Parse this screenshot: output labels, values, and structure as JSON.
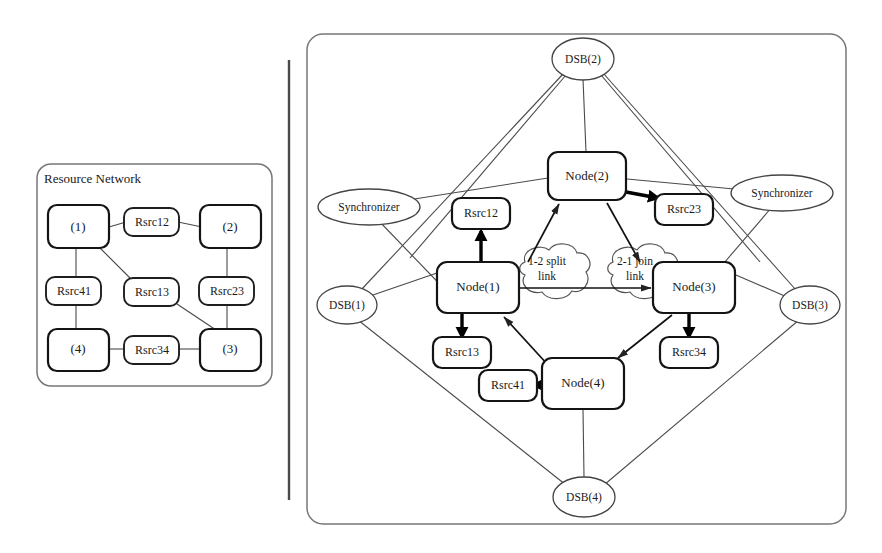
{
  "figure": {
    "type": "diagram"
  },
  "left_panel": {
    "title": "Resource Network",
    "nodes": [
      {
        "id": "n1",
        "label": "(1)",
        "x": 76,
        "y": 227
      },
      {
        "id": "n2",
        "label": "(2)",
        "x": 227,
        "y": 227
      },
      {
        "id": "n3",
        "label": "(3)",
        "x": 227,
        "y": 349
      },
      {
        "id": "n4",
        "label": "(4)",
        "x": 76,
        "y": 349
      }
    ],
    "resources": [
      {
        "id": "r12",
        "label": "Rsrc12",
        "x": 152,
        "y": 222
      },
      {
        "id": "r41",
        "label": "Rsrc41",
        "x": 73,
        "y": 291
      },
      {
        "id": "r13",
        "label": "Rsrc13",
        "x": 152,
        "y": 292
      },
      {
        "id": "r23",
        "label": "Rsrc23",
        "x": 227,
        "y": 291
      },
      {
        "id": "r34",
        "label": "Rsrc34",
        "x": 152,
        "y": 349
      }
    ],
    "links": [
      {
        "from": "n1",
        "to": "r12"
      },
      {
        "from": "r12",
        "to": "n2"
      },
      {
        "from": "n1",
        "to": "r41"
      },
      {
        "from": "r41",
        "to": "n4"
      },
      {
        "from": "n1",
        "to": "r13"
      },
      {
        "from": "r13",
        "to": "n3"
      },
      {
        "from": "n2",
        "to": "r23"
      },
      {
        "from": "r23",
        "to": "n3"
      },
      {
        "from": "n4",
        "to": "r34"
      },
      {
        "from": "r34",
        "to": "n3"
      }
    ]
  },
  "right_panel": {
    "nodes": [
      {
        "id": "N1",
        "label": "Node(1)",
        "x": 478,
        "y": 287
      },
      {
        "id": "N2",
        "label": "Node(2)",
        "x": 586,
        "y": 176
      },
      {
        "id": "N3",
        "label": "Node(3)",
        "x": 695,
        "y": 287
      },
      {
        "id": "N4",
        "label": "Node(4)",
        "x": 583,
        "y": 383
      }
    ],
    "resources": [
      {
        "id": "R12",
        "label": "Rsrc12",
        "x": 481,
        "y": 213
      },
      {
        "id": "R23",
        "label": "Rsrc23",
        "x": 684,
        "y": 210
      },
      {
        "id": "R13",
        "label": "Rsrc13",
        "x": 462,
        "y": 352
      },
      {
        "id": "R34",
        "label": "Rsrc34",
        "x": 689,
        "y": 352
      },
      {
        "id": "R41",
        "label": "Rsrc41",
        "x": 508,
        "y": 385
      }
    ],
    "dsbs": [
      {
        "id": "DSB2",
        "label": "DSB(2)",
        "x": 583,
        "y": 59
      },
      {
        "id": "DSB1",
        "label": "DSB(1)",
        "x": 347,
        "y": 305
      },
      {
        "id": "DSB3",
        "label": "DSB(3)",
        "x": 810,
        "y": 305
      },
      {
        "id": "DSB4",
        "label": "DSB(4)",
        "x": 584,
        "y": 497
      }
    ],
    "synchronizers": [
      {
        "id": "SYNC_L",
        "label": "Synchronizer",
        "x": 369,
        "y": 207
      },
      {
        "id": "SYNC_R",
        "label": "Synchronizer",
        "x": 782,
        "y": 193
      }
    ],
    "links": [
      {
        "id": "split",
        "label_line1": "1-2 split",
        "label_line2": "link",
        "x": 546,
        "y": 265
      },
      {
        "id": "join",
        "label_line1": "2-1 join",
        "label_line2": "link",
        "x": 634,
        "y": 265
      }
    ]
  },
  "colors": {
    "stroke": "#141414",
    "panel_border": "#777777",
    "thin_line": "#4a4a4a",
    "background": "#ffffff"
  }
}
